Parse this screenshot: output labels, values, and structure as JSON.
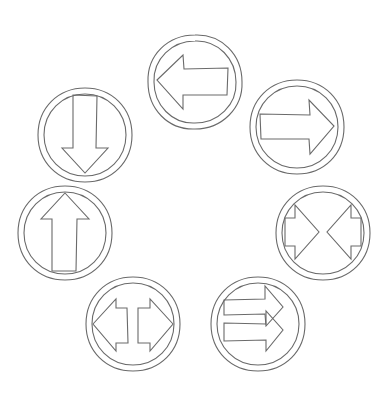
{
  "diagram": {
    "stroke_color": "#6a6a6a",
    "background": "#ffffff",
    "signs": [
      {
        "id": "left",
        "label": "Left arrow",
        "center": [
          195,
          82
        ]
      },
      {
        "id": "right",
        "label": "Right arrow",
        "center": [
          297,
          127
        ]
      },
      {
        "id": "converge",
        "label": "Converging arrows",
        "center": [
          323,
          233
        ]
      },
      {
        "id": "double-right",
        "label": "Two right arrows",
        "center": [
          258,
          324
        ]
      },
      {
        "id": "diverge",
        "label": "Diverging arrows",
        "center": [
          133,
          324
        ]
      },
      {
        "id": "up",
        "label": "Up arrow",
        "center": [
          65,
          233
        ]
      },
      {
        "id": "down",
        "label": "Down arrow",
        "center": [
          85,
          135
        ]
      }
    ]
  }
}
